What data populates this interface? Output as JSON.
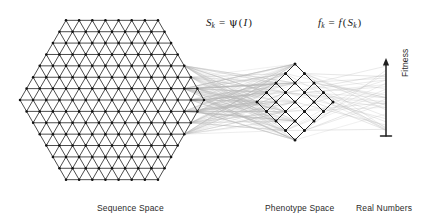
{
  "figure": {
    "caption_labels": {
      "sequence_space": "Sequence Space",
      "phenotype_space": "Phenotype Space",
      "real_numbers": "Real Numbers",
      "fitness": "Fitness"
    },
    "formulas": {
      "genotype_to_phenotype": {
        "lhs_symbol": "S",
        "lhs_subscript": "k",
        "equals": "=",
        "function": "ψ",
        "argument": "(I)",
        "plain": "S_k = ψ(I)"
      },
      "phenotype_to_fitness": {
        "lhs_symbol": "f",
        "lhs_subscript": "k",
        "equals": "=",
        "function": "f",
        "argument": "(S_k)",
        "plain": "f_k = f(S_k)"
      }
    },
    "colors": {
      "lattice_stroke": "#1a1a1a",
      "node_fill": "#111111",
      "mapping_line": "#b5b5b5",
      "axis_stroke": "#1f1f1f",
      "text": "#2b2b2b",
      "background": "#ffffff"
    },
    "structures": {
      "sequence_space": {
        "shape": "hexagon",
        "lattice": "triangular",
        "center_x": 112,
        "center_y": 100,
        "radius": 92,
        "rings": 7
      },
      "phenotype_space": {
        "shape": "diamond",
        "lattice": "square-rotated-45",
        "center_x": 295,
        "center_y": 102,
        "half_diagonal": 38,
        "grid": 5
      },
      "real_numbers": {
        "shape": "vertical-axis-arrow",
        "x": 386,
        "top_y": 58,
        "bottom_y": 136,
        "arrowhead": "up",
        "baseline_tick": true
      }
    },
    "mapping_lines": {
      "genotype_to_phenotype_count": 220,
      "phenotype_to_fitness_count": 40,
      "style": "many-to-one fan"
    }
  }
}
